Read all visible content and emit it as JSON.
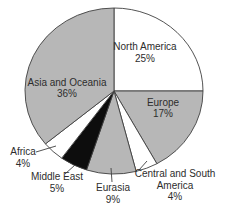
{
  "chart_data": {
    "type": "pie",
    "title": "",
    "unit": "%",
    "direction": "clockwise",
    "start_angle_deg": 0,
    "background": "#ffffff",
    "outline_color": "#404040",
    "text_color": "#2d2d2d",
    "slices": [
      {
        "label": "North America",
        "value": 25,
        "color": "#ffffff"
      },
      {
        "label": "Europe",
        "value": 17,
        "color": "#b7b7b7"
      },
      {
        "label": "Central and South America",
        "value": 4,
        "color": "#ffffff"
      },
      {
        "label": "Eurasia",
        "value": 9,
        "color": "#b7b7b7"
      },
      {
        "label": "Middle East",
        "value": 5,
        "color": "#0d0d0d"
      },
      {
        "label": "Africa",
        "value": 4,
        "color": "#ffffff"
      },
      {
        "label": "Asia and Oceania",
        "value": 36,
        "color": "#b7b7b7"
      }
    ],
    "geometry": {
      "cx": 114,
      "cy": 91,
      "rx": 89,
      "ry": 83
    },
    "labels": [
      {
        "slice": "North America",
        "lines": [
          "North America",
          "25%"
        ],
        "x": 145,
        "y": 50,
        "line_h": 12,
        "leader": null
      },
      {
        "slice": "Europe",
        "lines": [
          "Europe",
          "17%"
        ],
        "x": 163,
        "y": 106,
        "line_h": 11,
        "leader": null
      },
      {
        "slice": "Central and South America",
        "lines": [
          "Central and South",
          "America",
          "4%"
        ],
        "x": 175,
        "y": 177,
        "line_h": 11.5,
        "leader": {
          "x1": 139,
          "y1": 170,
          "x2": 147,
          "y2": 161
        }
      },
      {
        "slice": "Eurasia",
        "lines": [
          "Eurasia",
          "9%"
        ],
        "x": 113,
        "y": 191,
        "line_h": 12,
        "leader": {
          "x1": 112,
          "y1": 182,
          "x2": 111,
          "y2": 168
        }
      },
      {
        "slice": "Middle East",
        "lines": [
          "Middle East",
          "5%"
        ],
        "x": 57,
        "y": 180,
        "line_h": 12,
        "leader": {
          "x1": 65,
          "y1": 174,
          "x2": 75,
          "y2": 165
        }
      },
      {
        "slice": "Africa",
        "lines": [
          "Africa",
          "4%"
        ],
        "x": 23,
        "y": 155,
        "line_h": 12,
        "leader": {
          "x1": 36,
          "y1": 152,
          "x2": 56,
          "y2": 146
        }
      },
      {
        "slice": "Asia and Oceania",
        "lines": [
          "Asia and Oceania",
          "36%"
        ],
        "x": 67,
        "y": 86,
        "line_h": 11,
        "leader": null
      }
    ]
  }
}
